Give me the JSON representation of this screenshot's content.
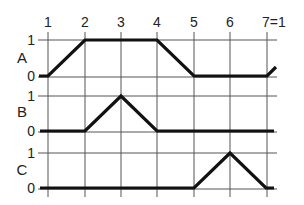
{
  "diagram": {
    "title": "",
    "columns": [
      "1",
      "2",
      "3",
      "4",
      "5",
      "6",
      "7=1"
    ],
    "rows": [
      {
        "name": "A",
        "high_label": "1",
        "low_label": "0",
        "values": [
          0,
          1,
          1,
          1,
          0,
          0,
          0,
          0.35
        ]
      },
      {
        "name": "B",
        "high_label": "1",
        "low_label": "0",
        "values": [
          0,
          0,
          1,
          0,
          0,
          0,
          0
        ]
      },
      {
        "name": "C",
        "high_label": "1",
        "low_label": "0",
        "values": [
          0,
          0,
          0,
          0,
          0,
          1,
          0
        ]
      }
    ],
    "colors": {
      "trace": "#111111",
      "grid": "#555555",
      "background": "#ffffff"
    }
  }
}
